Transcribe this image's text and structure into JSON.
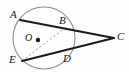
{
  "figure": {
    "background_color": "#fdfdfd",
    "stroke_color": "#1a1a1a",
    "circle_stroke_color": "#8a8a8a",
    "dashed_stroke_color": "#9a9a9a",
    "width": 129,
    "height": 72
  },
  "labels": {
    "A": "A",
    "B": "B",
    "C": "C",
    "D": "D",
    "E": "E",
    "O": "O"
  },
  "geometry": {
    "circle": {
      "center_x": 44,
      "center_y": 38,
      "radius": 31
    },
    "center_dot": {
      "x": 38,
      "y": 40,
      "radius": 2.2
    },
    "points": {
      "A": {
        "x": 20,
        "y": 20
      },
      "B": {
        "x": 66,
        "y": 27
      },
      "C": {
        "x": 114,
        "y": 38
      },
      "D": {
        "x": 68,
        "y": 56
      },
      "E": {
        "x": 22,
        "y": 61
      },
      "O": {
        "x": 38,
        "y": 40
      }
    },
    "segments": [
      {
        "name": "secant-ABC",
        "from": "A",
        "to": "C",
        "style": "solid"
      },
      {
        "name": "secant-EDC",
        "from": "E",
        "to": "C",
        "style": "solid"
      },
      {
        "name": "chord-EB",
        "from": "E",
        "to": "B",
        "style": "dashed"
      }
    ]
  }
}
